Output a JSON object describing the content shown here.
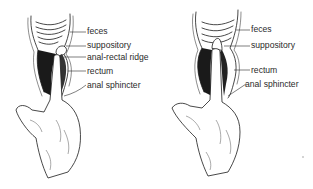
{
  "figure": {
    "panels": [
      {
        "id": "left",
        "description": "Finger inserting suppository past the anal-rectal ridge, suppository against feces",
        "labels": [
          "feces",
          "suppository",
          "anal-rectal ridge",
          "rectum",
          "anal sphincter"
        ]
      },
      {
        "id": "right",
        "description": "Finger inserting suppository into feces (incorrect placement)",
        "labels": [
          "feces",
          "suppository",
          "rectum",
          "anal sphincter"
        ]
      }
    ],
    "colors": {
      "ink": "#1a1a1a",
      "background": "#ffffff",
      "label": "#2a2a2a"
    }
  }
}
